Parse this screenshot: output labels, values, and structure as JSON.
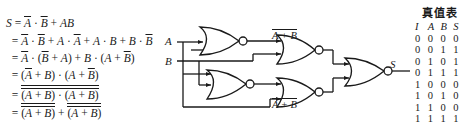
{
  "derivation": {
    "line1": {
      "lhs": "S",
      "eq": "=",
      "a_bar": "A",
      "dot": "·",
      "b_bar": "B",
      "plus_ab": "+ AB"
    },
    "line2": "= A̅ · B̅ + A · A̅ + A · B + B · B̅",
    "line3": "= A̅ · (B̅ + A) + B · (A + B̅)",
    "line4": "= (A̅ + B) · (A + B̅)",
    "line5": "= (A̅ + B) · (A + B̅)  [double overline]",
    "line6": "= (A̅ + B) + (A + B̅)  [each overlined]"
  },
  "circuit": {
    "inputs": [
      "A",
      "B"
    ],
    "output": "S",
    "label_top": "A + B",
    "label_bottom": "A + B",
    "gates": "NOR"
  },
  "truth_table": {
    "title": "真值表",
    "headers": [
      "I",
      "A",
      "B",
      "S"
    ],
    "rows": [
      [
        "0",
        "0",
        "0",
        "0"
      ],
      [
        "0",
        "0",
        "1",
        "1"
      ],
      [
        "0",
        "1",
        "0",
        "1"
      ],
      [
        "0",
        "1",
        "1",
        "1"
      ],
      [
        "1",
        "0",
        "0",
        "0"
      ],
      [
        "1",
        "0",
        "1",
        "0"
      ],
      [
        "1",
        "1",
        "0",
        "0"
      ],
      [
        "1",
        "1",
        "1",
        "1"
      ]
    ]
  }
}
